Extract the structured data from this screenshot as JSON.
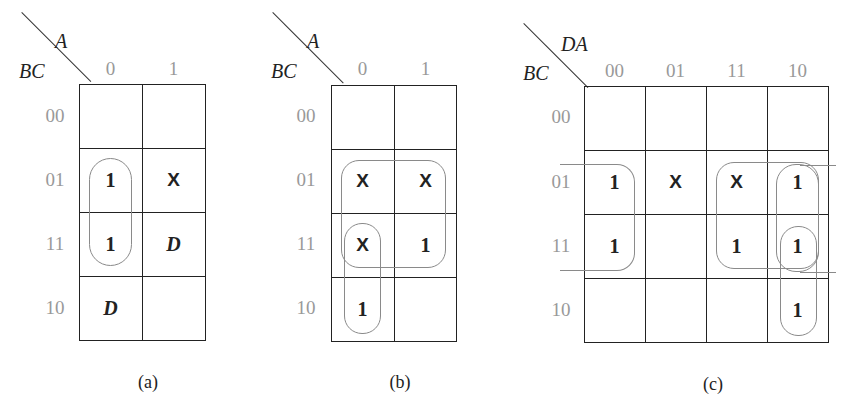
{
  "maps": [
    {
      "caption": "(a)",
      "col_var": "A",
      "row_var": "BC",
      "col_headers": [
        "0",
        "1"
      ],
      "row_headers": [
        "00",
        "01",
        "11",
        "10"
      ],
      "cells": [
        [
          "",
          ""
        ],
        [
          "1",
          "X"
        ],
        [
          "1",
          "D"
        ],
        [
          "D",
          ""
        ]
      ]
    },
    {
      "caption": "(b)",
      "col_var": "A",
      "row_var": "BC",
      "col_headers": [
        "0",
        "1"
      ],
      "row_headers": [
        "00",
        "01",
        "11",
        "10"
      ],
      "cells": [
        [
          "",
          ""
        ],
        [
          "X",
          "X"
        ],
        [
          "X",
          "1"
        ],
        [
          "1",
          ""
        ]
      ]
    },
    {
      "caption": "(c)",
      "col_var": "DA",
      "row_var": "BC",
      "col_headers": [
        "00",
        "01",
        "11",
        "10"
      ],
      "row_headers": [
        "00",
        "01",
        "11",
        "10"
      ],
      "cells": [
        [
          "",
          "",
          "",
          ""
        ],
        [
          "1",
          "X",
          "X",
          "1"
        ],
        [
          "1",
          "",
          "1",
          "1"
        ],
        [
          "",
          "",
          "",
          "1"
        ]
      ]
    }
  ],
  "groupings": {
    "a": [
      "A'C (cells BC=01,11 at A=0)"
    ],
    "b": [
      "C (rows 01,11 both columns)",
      "A'B (rows 11,10 at A=0)"
    ],
    "c": [
      "rows 01,11 wrap-around columns 00 and 10",
      "rows 01,11 columns 11,10",
      "column 10 rows 01,11",
      "column 10 rows 11,10"
    ]
  }
}
